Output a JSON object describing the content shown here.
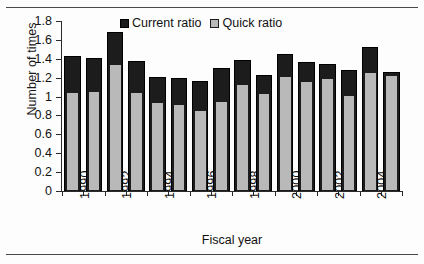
{
  "chart_data": {
    "type": "bar",
    "title": "",
    "xlabel": "Fiscal year",
    "ylabel": "Number of times",
    "ylim": [
      0,
      1.8
    ],
    "yticks": [
      "0",
      "0.2",
      "0.4",
      "0.6",
      "0.8",
      "1",
      "1.2",
      "1.4",
      "1.6",
      "1.8"
    ],
    "ytick_values": [
      0,
      0.2,
      0.4,
      0.6,
      0.8,
      1.0,
      1.2,
      1.4,
      1.6,
      1.8
    ],
    "grid": false,
    "legend_position": "top-center",
    "categories": [
      1990,
      1991,
      1992,
      1993,
      1994,
      1995,
      1996,
      1997,
      1998,
      1999,
      2000,
      2001,
      2002,
      2003,
      2004,
      2005
    ],
    "xtick_labels": [
      "1990",
      "1992",
      "1994",
      "1996",
      "1998",
      "2000",
      "2002",
      "2004"
    ],
    "xtick_indices": [
      0,
      2,
      4,
      6,
      8,
      10,
      12,
      14
    ],
    "series": [
      {
        "name": "Current ratio",
        "color": "#1c1c1c",
        "values": [
          1.43,
          1.41,
          1.68,
          1.38,
          1.21,
          1.2,
          1.16,
          1.3,
          1.39,
          1.23,
          1.45,
          1.37,
          1.35,
          1.28,
          1.52,
          1.26
        ]
      },
      {
        "name": "Quick ratio",
        "color": "#b9b9b9",
        "values": [
          1.05,
          1.06,
          1.34,
          1.05,
          0.94,
          0.92,
          0.86,
          0.95,
          1.13,
          1.04,
          1.22,
          1.16,
          1.2,
          1.02,
          1.26,
          1.23
        ]
      }
    ]
  },
  "legend": {
    "items": [
      {
        "label": "Current ratio",
        "style": "current"
      },
      {
        "label": "Quick ratio",
        "style": "quick"
      }
    ]
  }
}
